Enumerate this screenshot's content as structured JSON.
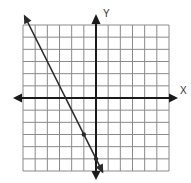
{
  "graph": {
    "x_axis_label": "X",
    "y_axis_label": "Y",
    "grid": {
      "x_min": -6,
      "x_max": 6,
      "y_min": -6,
      "y_max": 6,
      "step": 1
    },
    "colors": {
      "grid": "#8a8a8a",
      "axis": "#1a1a1a",
      "line": "#2a2a2a",
      "background": "#ffffff"
    }
  },
  "chart_data": {
    "type": "line",
    "title": "",
    "xlabel": "X",
    "ylabel": "Y",
    "xlim": [
      -6,
      6
    ],
    "ylim": [
      -6,
      6
    ],
    "grid": true,
    "series": [
      {
        "name": "line",
        "equation": "y = -2x - 5",
        "slope": -2,
        "intercept": -5,
        "marked_points": [
          [
            -1,
            -3
          ],
          [
            0,
            -5
          ]
        ],
        "arrows_both_ends": true
      }
    ]
  }
}
